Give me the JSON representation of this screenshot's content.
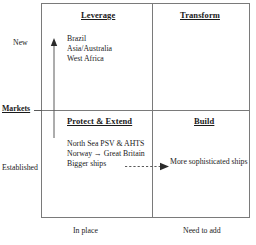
{
  "diagram": {
    "axes": {
      "y_axis_label": "Markets",
      "y_top_label": "New",
      "y_bottom_label": "Established",
      "x_left_label": "In place",
      "x_right_label": "Need to add"
    },
    "quadrants": [
      {
        "id": "leverage",
        "title": "Leverage",
        "position": "top-left",
        "items": [
          "Brazil",
          "Asia/Australia",
          "West Africa"
        ]
      },
      {
        "id": "transform",
        "title": "Transform",
        "position": "top-right",
        "items": []
      },
      {
        "id": "protect-extend",
        "title": "Protect & Extend",
        "position": "bottom-left",
        "items": [
          "North Sea PSV & AHTS",
          "Norway → Great Britain",
          "Bigger ships"
        ]
      },
      {
        "id": "build",
        "title": "Build",
        "position": "bottom-right",
        "items": []
      }
    ],
    "annotations": {
      "transition_target": "More sophisticated ships",
      "growth_arrow": "upward-arrow-icon",
      "transition_arrow": "dashed-right-arrow-icon"
    },
    "colors": {
      "line": "#7a7a7a",
      "text": "#1a1a1a",
      "arrow": "#2b2b2b",
      "background": "#ffffff"
    }
  }
}
